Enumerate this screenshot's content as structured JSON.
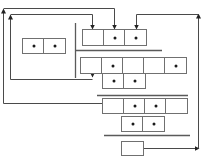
{
  "diagram": {
    "type": "linked-memory-structure",
    "colors": {
      "line": "#5a5a5a",
      "cell_border": "#707070",
      "dot": "#1a1a1a",
      "background": "#ffffff"
    },
    "records": [
      {
        "id": "left-record",
        "x": 22,
        "y": 38,
        "cell_w": 22,
        "h": 16,
        "cells": [
          true,
          true
        ]
      },
      {
        "id": "row1",
        "x": 82,
        "y": 29,
        "cell_w": 22,
        "h": 17,
        "cells": [
          false,
          true,
          true
        ]
      },
      {
        "id": "row2",
        "x": 80,
        "y": 57,
        "cell_w": 22,
        "h": 17,
        "cells": [
          false,
          true,
          false,
          false,
          true
        ]
      },
      {
        "id": "row3",
        "x": 102,
        "y": 73,
        "cell_w": 22,
        "h": 16,
        "cells": [
          true,
          true
        ]
      },
      {
        "id": "row4",
        "x": 102,
        "y": 98,
        "cell_w": 22,
        "h": 16,
        "cells": [
          false,
          true,
          true,
          false
        ]
      },
      {
        "id": "row5",
        "x": 121,
        "y": 116,
        "cell_w": 22,
        "h": 16,
        "cells": [
          true,
          true
        ]
      },
      {
        "id": "final-box",
        "x": 121,
        "y": 141,
        "cell_w": 22,
        "h": 15,
        "cells": [
          false
        ]
      }
    ],
    "separators": [
      {
        "orient": "v",
        "x": 75,
        "y1": 23,
        "y2": 78
      },
      {
        "orient": "h",
        "y": 50,
        "x1": 75,
        "x2": 162
      },
      {
        "orient": "h",
        "y": 95,
        "x1": 97,
        "x2": 188
      },
      {
        "orient": "h",
        "y": 135,
        "x1": 104,
        "x2": 190
      }
    ],
    "arrows": [
      {
        "id": "outer-left-loop",
        "points": [
          [
            102,
            103
          ],
          [
            3,
            103
          ],
          [
            3,
            9
          ]
        ],
        "head": "up"
      },
      {
        "id": "outer-top",
        "points": [
          [
            3,
            8
          ],
          [
            114,
            8
          ],
          [
            114,
            28
          ]
        ],
        "head": "down"
      },
      {
        "id": "inner-left-loop",
        "points": [
          [
            92,
            79
          ],
          [
            10,
            79
          ],
          [
            10,
            15
          ]
        ],
        "head": "up"
      },
      {
        "id": "inner-top",
        "points": [
          [
            10,
            14
          ],
          [
            92,
            14
          ],
          [
            92,
            28
          ]
        ],
        "head": "down"
      },
      {
        "id": "row2-to-row3",
        "points": [
          [
            92,
            74
          ],
          [
            92,
            76
          ]
        ],
        "head": "down"
      },
      {
        "id": "final-to-right",
        "points": [
          [
            143,
            148
          ],
          [
            198,
            148
          ]
        ],
        "head": "right"
      },
      {
        "id": "right-loop",
        "points": [
          [
            198,
            148
          ],
          [
            198,
            14
          ]
        ],
        "head": "up"
      },
      {
        "id": "right-top",
        "points": [
          [
            198,
            14
          ],
          [
            136,
            14
          ],
          [
            136,
            28
          ]
        ],
        "head": "down"
      }
    ]
  }
}
